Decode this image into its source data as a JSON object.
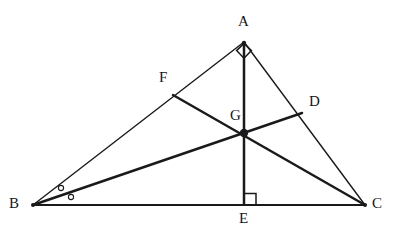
{
  "figure": {
    "type": "geometry-diagram",
    "canvas": {
      "width": 397,
      "height": 237,
      "background": "#ffffff"
    },
    "stroke_color": "#1a1a1c",
    "points": [
      {
        "id": "A",
        "label": "A",
        "x": 244,
        "y": 42,
        "label_x": 238,
        "label_y": 14,
        "vertex": true
      },
      {
        "id": "B",
        "label": "B",
        "x": 33,
        "y": 205,
        "label_x": 9,
        "label_y": 196,
        "vertex": true
      },
      {
        "id": "C",
        "label": "C",
        "x": 365,
        "y": 205,
        "label_x": 372,
        "label_y": 196,
        "vertex": true
      },
      {
        "id": "D",
        "label": "D",
        "x": 302,
        "y": 113,
        "label_x": 309,
        "label_y": 94,
        "vertex": false
      },
      {
        "id": "E",
        "label": "E",
        "x": 244,
        "y": 205,
        "label_x": 239,
        "label_y": 211,
        "vertex": false
      },
      {
        "id": "F",
        "label": "F",
        "x": 173,
        "y": 95,
        "label_x": 159,
        "label_y": 70,
        "vertex": false
      },
      {
        "id": "G",
        "label": "G",
        "x": 244,
        "y": 133,
        "label_x": 230,
        "label_y": 108,
        "vertex": false
      }
    ],
    "segments": [
      {
        "id": "AB",
        "from": "A",
        "to": "B",
        "width": 1.4
      },
      {
        "id": "AC",
        "from": "A",
        "to": "C",
        "width": 1.4
      },
      {
        "id": "BC",
        "from": "B",
        "to": "C",
        "width": 1.8
      },
      {
        "id": "AE",
        "from": "A",
        "to": "E",
        "width": 2.6
      },
      {
        "id": "BD",
        "from": "B",
        "to": "D",
        "width": 2.6
      },
      {
        "id": "CF",
        "from": "C",
        "to": "F",
        "width": 2.6
      }
    ],
    "markers": {
      "right_angle_A": {
        "at": "A",
        "size": 11,
        "label": "right-angle-at-a"
      },
      "right_angle_E": {
        "at": "E",
        "size": 11,
        "label": "right-angle-at-e"
      },
      "angle_marks_B": [
        {
          "x": 61,
          "y": 188,
          "r": 2.6
        },
        {
          "x": 71,
          "y": 197,
          "r": 2.6
        }
      ],
      "centroid_dot": {
        "at": "G",
        "r": 4.2
      }
    }
  }
}
